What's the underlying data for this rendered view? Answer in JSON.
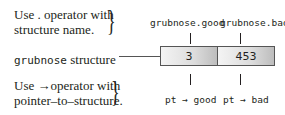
{
  "notes": {
    "dot_line1": "Use . operator with",
    "dot_line2": "structure name.",
    "arrow_line1": "Use →operator with",
    "arrow_line2": "pointer–to–structure."
  },
  "structure": {
    "label_mono": "grubnose",
    "label_rest": " structure",
    "fields": [
      {
        "name_dot": "grubnose.good",
        "value": "3",
        "name_arrow": "pt → good"
      },
      {
        "name_dot": "grubnose.bad",
        "value": "453",
        "name_arrow": "pt → bad"
      }
    ]
  }
}
